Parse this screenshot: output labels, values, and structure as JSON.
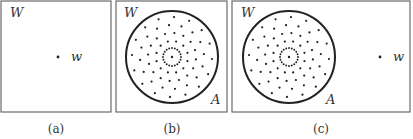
{
  "figure": {
    "panels": [
      {
        "id": "a",
        "caption": "(a)",
        "frame_label": "W",
        "has_region": false,
        "point_label": "w",
        "has_point": true
      },
      {
        "id": "b",
        "caption": "(b)",
        "frame_label": "W",
        "has_region": true,
        "region_label": "A",
        "has_point": false
      },
      {
        "id": "c",
        "caption": "(c)",
        "frame_label": "W",
        "has_region": true,
        "region_label": "A",
        "point_label": "w",
        "has_point": true
      }
    ],
    "dot_pattern": {
      "center_dot": true,
      "rings_dot_counts": [
        20,
        12,
        16,
        16,
        16
      ]
    }
  }
}
